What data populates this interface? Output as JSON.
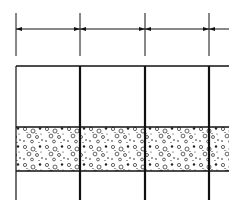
{
  "diagram": {
    "type": "section-elevation",
    "colors": {
      "line": "#111111",
      "background": "#ffffff",
      "speckle": "#222222"
    },
    "dimension_chain": {
      "y": 29,
      "extension_top": 13,
      "extension_bottom": 56,
      "ticks_x": [
        16,
        80,
        145,
        209
      ],
      "extends_to_x": 229,
      "labels": []
    },
    "frame": {
      "top_y": 66,
      "left_x": 16,
      "right_x": 229,
      "bottom_y": 200,
      "members_x": [
        16,
        80,
        145,
        209
      ]
    },
    "aggregate_band": {
      "top_y": 127,
      "bottom_y": 171,
      "pattern": "concrete-aggregate"
    }
  }
}
